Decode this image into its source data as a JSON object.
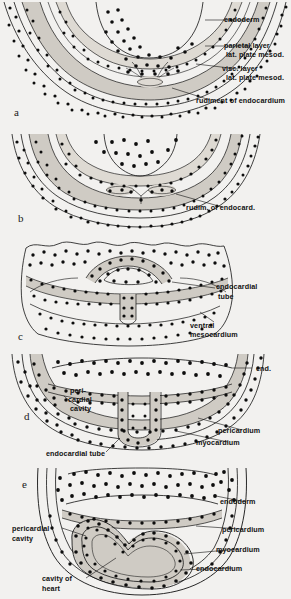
{
  "figure": {
    "background_color": "#f2f1ef",
    "ink_color": "#111111",
    "stipple_color": "#0d0d0d",
    "mesoderm_fill": "#cfcbc4",
    "panel_count": 5
  },
  "panels": [
    {
      "letter": "a",
      "labels": [
        {
          "text": "endoderm",
          "name": "label-endoderm"
        },
        {
          "text": "parietal layer",
          "name": "label-parietal-layer-line1"
        },
        {
          "text": "lat. plate mesod.",
          "name": "label-parietal-layer-line2"
        },
        {
          "text": "visc. layer",
          "name": "label-visceral-layer-line1"
        },
        {
          "text": "lat. plate mesod.",
          "name": "label-visceral-layer-line2"
        },
        {
          "text": "rudiment of endocardium",
          "name": "label-rudiment-endocardium"
        }
      ]
    },
    {
      "letter": "b",
      "labels": [
        {
          "text": "rudim. of endocard.",
          "name": "label-rudim-endocard"
        }
      ]
    },
    {
      "letter": "c",
      "labels": [
        {
          "text": "endocardial",
          "name": "label-endocardial-tube-line1"
        },
        {
          "text": "tube",
          "name": "label-endocardial-tube-line2"
        },
        {
          "text": "ventral",
          "name": "label-ventral-mesocardium-line1"
        },
        {
          "text": "mesocardium",
          "name": "label-ventral-mesocardium-line2"
        }
      ]
    },
    {
      "letter": "d",
      "labels": [
        {
          "text": "end.",
          "name": "label-end-abbrev"
        },
        {
          "text": "peri-",
          "name": "label-pericardial-cavity-line1"
        },
        {
          "text": "cardial",
          "name": "label-pericardial-cavity-line2"
        },
        {
          "text": "cavity",
          "name": "label-pericardial-cavity-line3"
        },
        {
          "text": "pericardium",
          "name": "label-pericardium"
        },
        {
          "text": "myocardium",
          "name": "label-myocardium"
        },
        {
          "text": "endocardial tube",
          "name": "label-endocardial-tube"
        }
      ]
    },
    {
      "letter": "e",
      "labels": [
        {
          "text": "endoderm",
          "name": "label-endoderm"
        },
        {
          "text": "pericardium",
          "name": "label-pericardium"
        },
        {
          "text": "myocardium",
          "name": "label-myocardium"
        },
        {
          "text": "endocardium",
          "name": "label-endocardium"
        },
        {
          "text": "pericardial",
          "name": "label-pericardial-cavity-line1"
        },
        {
          "text": "cavity",
          "name": "label-pericardial-cavity-line2"
        },
        {
          "text": "cavity of",
          "name": "label-cavity-of-heart-line1"
        },
        {
          "text": "heart",
          "name": "label-cavity-of-heart-line2"
        }
      ]
    }
  ]
}
